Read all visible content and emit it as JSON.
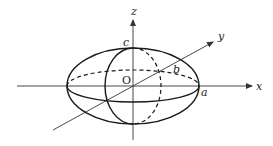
{
  "diagram": {
    "axes": {
      "x": {
        "label": "x"
      },
      "y": {
        "label": "y"
      },
      "z": {
        "label": "z"
      }
    },
    "origin_label": "O",
    "semi_axis_labels": {
      "a": "a",
      "b": "b",
      "c": "c"
    },
    "colors": {
      "stroke": "#1a1a1a",
      "axis": "#333333",
      "background": "#ffffff"
    }
  }
}
